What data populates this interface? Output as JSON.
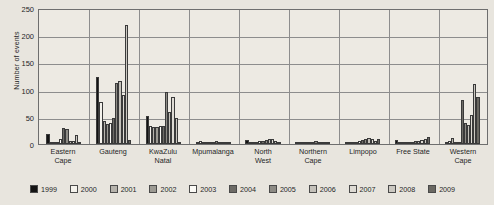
{
  "chart_data": {
    "type": "bar",
    "title": "",
    "xlabel": "",
    "ylabel": "Number of events",
    "ylim": [
      0,
      250
    ],
    "yticks": [
      0,
      50,
      100,
      150,
      200,
      250
    ],
    "grid": true,
    "legend_position": "bottom",
    "categories": [
      "Eastern Cape",
      "Gauteng",
      "KwaZulu Natal",
      "Mpumalanga",
      "North West",
      "Northern Cape",
      "Limpopo",
      "Free State",
      "Western Cape"
    ],
    "category_lines": [
      [
        "Eastern",
        "Cape"
      ],
      [
        "Gauteng",
        ""
      ],
      [
        "KwaZulu",
        "Natal"
      ],
      [
        "Mpumalanga",
        ""
      ],
      [
        "North",
        "West"
      ],
      [
        "Northern",
        "Cape"
      ],
      [
        "Limpopo",
        ""
      ],
      [
        "Free State",
        ""
      ],
      [
        "Western",
        "Cape"
      ]
    ],
    "series": [
      {
        "name": "1999",
        "color": "#141414",
        "values": [
          18,
          124,
          51,
          0,
          7,
          0,
          2,
          8,
          3
        ]
      },
      {
        "name": "2000",
        "color": "#f4f2ec",
        "values": [
          2,
          78,
          33,
          6,
          3,
          2,
          3,
          4,
          5
        ]
      },
      {
        "name": "2001",
        "color": "#b6b3ac",
        "values": [
          3,
          43,
          31,
          4,
          4,
          2,
          2,
          3,
          11
        ]
      },
      {
        "name": "2002",
        "color": "#9c9a93",
        "values": [
          4,
          37,
          31,
          3,
          3,
          3,
          2,
          3,
          4
        ]
      },
      {
        "name": "2003",
        "color": "#fbfaf6",
        "values": [
          9,
          39,
          34,
          4,
          6,
          2,
          5,
          4,
          4
        ]
      },
      {
        "name": "2004",
        "color": "#6d6b66",
        "values": [
          29,
          48,
          34,
          4,
          5,
          4,
          7,
          4,
          81
        ]
      },
      {
        "name": "2005",
        "color": "#8d8b85",
        "values": [
          27,
          112,
          96,
          5,
          7,
          5,
          10,
          5,
          39
        ]
      },
      {
        "name": "2006",
        "color": "#c4c1ba",
        "values": [
          5,
          116,
          59,
          4,
          9,
          3,
          11,
          6,
          35
        ]
      },
      {
        "name": "2007",
        "color": "#dedbd4",
        "values": [
          5,
          90,
          86,
          3,
          10,
          3,
          9,
          7,
          54
        ]
      },
      {
        "name": "2008",
        "color": "#cbc8c1",
        "values": [
          16,
          218,
          47,
          4,
          6,
          3,
          6,
          9,
          111
        ]
      },
      {
        "name": "2009",
        "color": "#6a6862",
        "values": [
          3,
          8,
          3,
          2,
          3,
          2,
          9,
          12,
          86
        ]
      }
    ]
  }
}
